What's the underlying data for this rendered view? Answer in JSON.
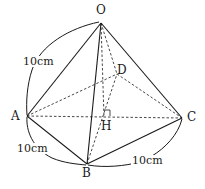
{
  "figure": {
    "type": "square pyramid (solid geometry)",
    "vertices": {
      "O": {
        "label": "O",
        "x": 101,
        "y": 23
      },
      "A": {
        "label": "A",
        "x": 27,
        "y": 116
      },
      "B": {
        "label": "B",
        "x": 87,
        "y": 164
      },
      "C": {
        "label": "C",
        "x": 182,
        "y": 118
      },
      "D": {
        "label": "D",
        "x": 117,
        "y": 74
      },
      "H": {
        "label": "H",
        "x": 104,
        "y": 117
      }
    },
    "solid_edges": [
      [
        "O",
        "A"
      ],
      [
        "O",
        "B"
      ],
      [
        "O",
        "C"
      ],
      [
        "A",
        "B"
      ],
      [
        "B",
        "C"
      ]
    ],
    "dashed_edges": [
      [
        "O",
        "D"
      ],
      [
        "A",
        "D"
      ],
      [
        "D",
        "C"
      ],
      [
        "A",
        "C"
      ],
      [
        "B",
        "D"
      ],
      [
        "O",
        "H"
      ]
    ],
    "right_angle_at": "H",
    "measurements": [
      {
        "label": "10cm",
        "between": [
          "O",
          "A"
        ]
      },
      {
        "label": "10cm",
        "between": [
          "A",
          "B"
        ]
      },
      {
        "label": "10cm",
        "between": [
          "B",
          "C"
        ]
      }
    ]
  },
  "labels": {
    "O": "O",
    "A": "A",
    "B": "B",
    "C": "C",
    "D": "D",
    "H": "H",
    "oa_length": "10cm",
    "ab_length": "10cm",
    "bc_length": "10cm"
  }
}
